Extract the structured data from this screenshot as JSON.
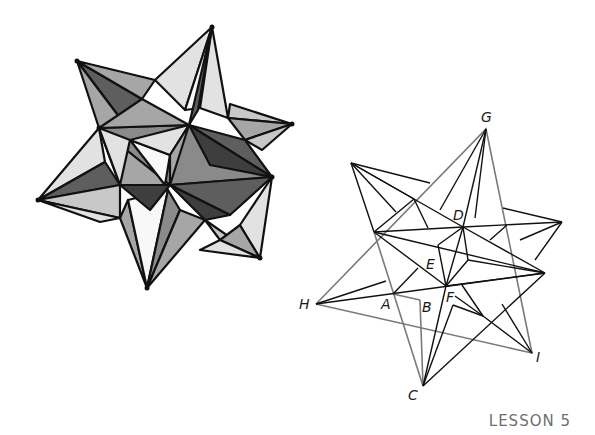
{
  "figure_left": {
    "description": "Shaded 3D model of a small stellated dodecahedron",
    "colors": {
      "light": "#e2e2e2",
      "mid": "#a6a6a6",
      "dark": "#5e5e5e",
      "darker": "#3e3e3e",
      "white": "#f8f8f8",
      "edge": "#111111"
    }
  },
  "figure_right": {
    "description": "Line drawing of stellated dodecahedron with labeled vertices",
    "edge_color": "#111111",
    "highlight_edge_color": "#7a7a7a",
    "vertex_labels": [
      {
        "id": "G",
        "label": "G"
      },
      {
        "id": "D",
        "label": "D"
      },
      {
        "id": "E",
        "label": "E"
      },
      {
        "id": "H",
        "label": "H"
      },
      {
        "id": "A",
        "label": "A"
      },
      {
        "id": "B",
        "label": "B"
      },
      {
        "id": "F",
        "label": "F"
      },
      {
        "id": "I",
        "label": "I"
      },
      {
        "id": "C",
        "label": "C"
      }
    ]
  },
  "footer": {
    "label": "LESSON 5"
  }
}
